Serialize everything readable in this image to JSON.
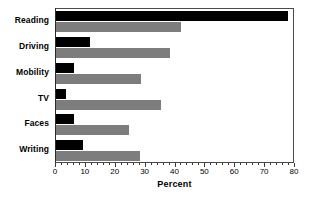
{
  "chart_data": {
    "type": "bar",
    "orientation": "horizontal",
    "title": "",
    "xlabel": "Percent",
    "ylabel": "",
    "xlim": [
      0,
      80
    ],
    "xticks": [
      0,
      10,
      20,
      30,
      40,
      50,
      60,
      70,
      80
    ],
    "xtick_labels": [
      "0",
      "10",
      "20",
      "30",
      "40",
      "50",
      "60",
      "70",
      "80"
    ],
    "grid": false,
    "legend": null,
    "categories": [
      "Reading",
      "Driving",
      "Mobility",
      "TV",
      "Faces",
      "Writing"
    ],
    "series": [
      {
        "name": "black-series",
        "color": "#000000",
        "values": [
          77.5,
          11.5,
          6.0,
          3.5,
          6.0,
          9.0
        ]
      },
      {
        "name": "gray-series",
        "color": "#7d7d7d",
        "values": [
          42.0,
          38.0,
          28.5,
          35.0,
          24.5,
          28.0
        ]
      }
    ]
  },
  "style": {
    "background": "#ffffff",
    "frame_color": "#4a4a4a",
    "bar_black": "#000000",
    "bar_gray": "#7d7d7d"
  }
}
